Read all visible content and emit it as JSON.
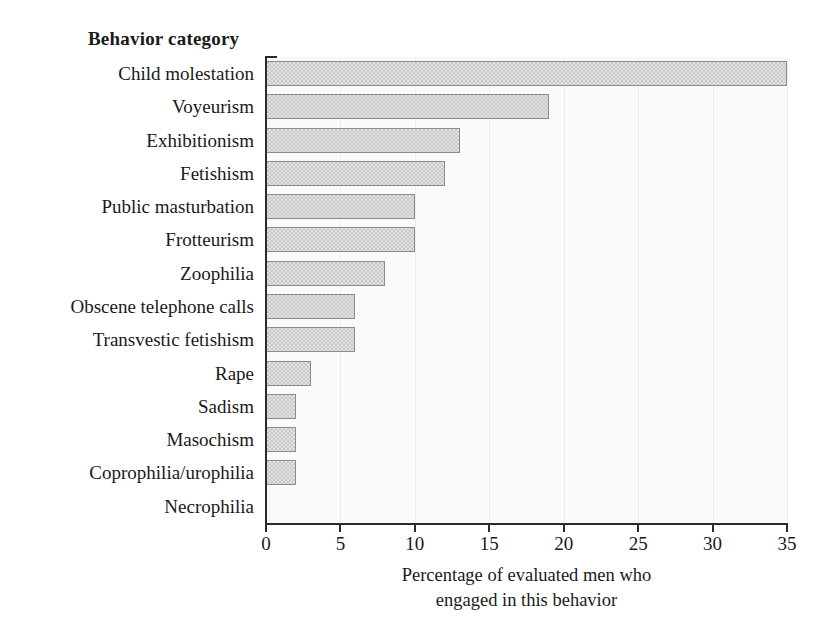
{
  "chart_data": {
    "type": "bar",
    "orientation": "horizontal",
    "title": "Behavior category",
    "xlabel": "Percentage of evaluated men who engaged in this behavior",
    "xlabel_lines": [
      "Percentage of evaluated men who",
      "engaged in this behavior"
    ],
    "ylabel": "Behavior category",
    "categories": [
      "Child molestation",
      "Voyeurism",
      "Exhibitionism",
      "Fetishism",
      "Public masturbation",
      "Frotteurism",
      "Zoophilia",
      "Obscene telephone calls",
      "Transvestic fetishism",
      "Rape",
      "Sadism",
      "Masochism",
      "Coprophilia/urophilia",
      "Necrophilia"
    ],
    "values": [
      35,
      19,
      13,
      12,
      10,
      10,
      8,
      6,
      6,
      3,
      2,
      2,
      2,
      0
    ],
    "xlim": [
      0,
      35
    ],
    "xticks": [
      0,
      5,
      10,
      15,
      20,
      25,
      30,
      35
    ],
    "xtick_labels": [
      "0",
      "5",
      "10",
      "15",
      "20",
      "25",
      "30",
      "35"
    ],
    "grid": "vertical-light",
    "legend": "none",
    "bar_fill_color": "#c9c9c9",
    "bar_border_color": "#8c8c8c",
    "axis_color": "#2b2b2b",
    "plot_background": "#fafafa"
  }
}
